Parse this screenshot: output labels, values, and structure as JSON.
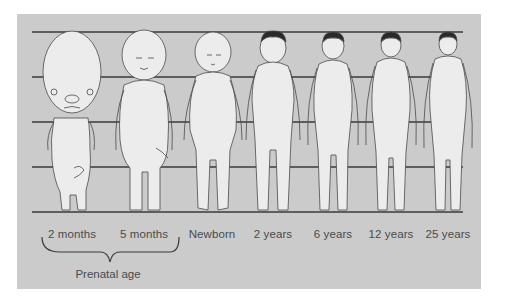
{
  "diagram": {
    "type": "body-proportion-comparison",
    "guide_lines": 5,
    "colors": {
      "page_background": "#ffffff",
      "panel_background": "#cbcbcb",
      "guide_line": "#3a3a3a",
      "figure_fill": "#ececec",
      "figure_outline": "#4a4a4a",
      "hair": "#2a2a2a",
      "label_text": "#4a4a4a"
    },
    "figures": [
      {
        "label": "2 months",
        "x": 72
      },
      {
        "label": "5 months",
        "x": 144
      },
      {
        "label": "Newborn",
        "x": 212
      },
      {
        "label": "2 years",
        "x": 273
      },
      {
        "label": "6 years",
        "x": 333
      },
      {
        "label": "12 years",
        "x": 391
      },
      {
        "label": "25 years",
        "x": 448
      }
    ],
    "group_bracket": {
      "label": "Prenatal age",
      "covers": [
        "2 months",
        "5 months"
      ]
    }
  }
}
